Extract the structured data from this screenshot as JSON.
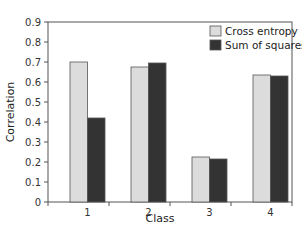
{
  "chart_data": {
    "type": "bar",
    "title": "",
    "xlabel": "Class",
    "ylabel": "Correlation",
    "categories": [
      "1",
      "2",
      "3",
      "4"
    ],
    "series": [
      {
        "name": "Cross entropy",
        "color": "#dcdcdc",
        "values": [
          0.7,
          0.675,
          0.225,
          0.635
        ]
      },
      {
        "name": "Sum of squares",
        "color": "#333333",
        "values": [
          0.42,
          0.695,
          0.215,
          0.63
        ]
      }
    ],
    "ylim": [
      0,
      0.9
    ],
    "yticks": [
      "0",
      "0.1",
      "0.2",
      "0.3",
      "0.4",
      "0.5",
      "0.6",
      "0.7",
      "0.8",
      "0.9"
    ],
    "grid": false,
    "legend_position": "upper right"
  }
}
